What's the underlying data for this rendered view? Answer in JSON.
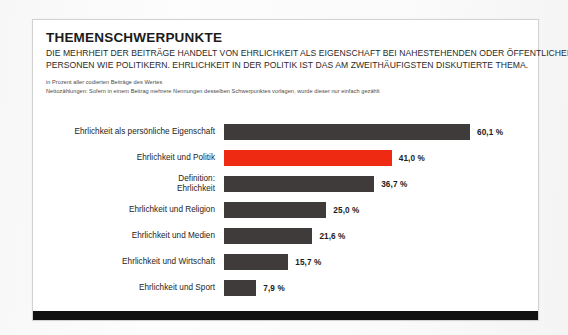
{
  "header": {
    "title": "THEMENSCHWERPUNKTE",
    "subtitle_lines": [
      "DIE MEHRHEIT DER BEITRÄGE HANDELT VON EHRLICHKEIT ALS EIGENSCHAFT BEI NAHESTEHENDEN ODER ÖFFENTLICHEN",
      "PERSONEN WIE POLITIKERN. EHRLICHKEIT IN DER POLITIK IST DAS AM ZWEITHÄUFIGSTEN DISKUTIERTE THEMA."
    ],
    "notes": [
      "in Prozent aller codierten Beiträge des Wertes",
      "Nettozählungen: Sofern in einem Beitrag mehrere Nennungen desselben Schwerpunktes vorlagen, wurde dieser nur einfach gezählt"
    ]
  },
  "colors": {
    "bar_default": "#3f3b3b",
    "bar_highlight": "#ee2a13",
    "card_background": "#ffffff",
    "bottom_rule": "#111111"
  },
  "chart_data": {
    "type": "bar",
    "orientation": "horizontal",
    "title": "THEMENSCHWERPUNKTE",
    "subtitle": "DIE MEHRHEIT DER BEITRÄGE HANDELT VON EHRLICHKEIT ALS EIGENSCHAFT BEI NAHESTEHENDEN ODER ÖFFENTLICHEN PERSONEN WIE POLITIKERN. EHRLICHKEIT IN DER POLITIK IST DAS AM ZWEITHÄUFIGSTEN DISKUTIERTE THEMA.",
    "xlabel": "",
    "ylabel": "",
    "xlim": [
      0,
      60.1
    ],
    "grid": false,
    "legend": false,
    "unit": "%",
    "categories": [
      "Ehrlichkeit als persönliche Eigenschaft",
      "Ehrlichkeit und Politik",
      "Definition:\nEhrlichkeit",
      "Ehrlichkeit und Religion",
      "Ehrlichkeit und Medien",
      "Ehrlichkeit und Wirtschaft",
      "Ehrlichkeit und Sport"
    ],
    "values": [
      60.1,
      41.0,
      36.7,
      25.0,
      21.6,
      15.7,
      7.9
    ],
    "value_labels": [
      "60,1 %",
      "41,0 %",
      "36,7 %",
      "25,0 %",
      "21,6 %",
      "15,7 %",
      "7,9 %"
    ],
    "highlight_index": 1,
    "bars": [
      {
        "label": "Ehrlichkeit als persönliche Eigenschaft",
        "value": 60.1,
        "value_label": "60,1 %",
        "highlight": false
      },
      {
        "label": "Ehrlichkeit und Politik",
        "value": 41.0,
        "value_label": "41,0 %",
        "highlight": true
      },
      {
        "label": "Definition:\nEhrlichkeit",
        "value": 36.7,
        "value_label": "36,7 %",
        "highlight": false
      },
      {
        "label": "Ehrlichkeit und Religion",
        "value": 25.0,
        "value_label": "25,0 %",
        "highlight": false
      },
      {
        "label": "Ehrlichkeit und Medien",
        "value": 21.6,
        "value_label": "21,6 %",
        "highlight": false
      },
      {
        "label": "Ehrlichkeit und Wirtschaft",
        "value": 15.7,
        "value_label": "15,7 %",
        "highlight": false
      },
      {
        "label": "Ehrlichkeit und Sport",
        "value": 7.9,
        "value_label": "7,9 %",
        "highlight": false
      }
    ]
  }
}
